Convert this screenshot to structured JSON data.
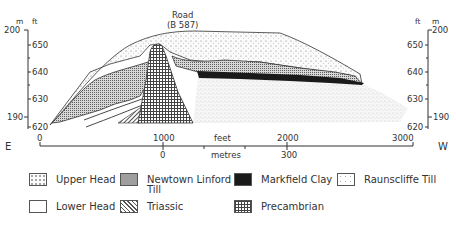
{
  "diagram": {
    "type": "geological cross-section",
    "road_label_line1": "Road",
    "road_label_line2": "(B 587)",
    "left_axis": {
      "unit_m": "m",
      "unit_ft": "ft",
      "m_ticks": [
        "200",
        "190"
      ],
      "ft_ticks": [
        "650",
        "640",
        "630",
        "620"
      ]
    },
    "right_axis": {
      "unit_ft": "ft",
      "unit_m": "m",
      "m_ticks": [
        "200",
        "190"
      ],
      "ft_ticks": [
        "650",
        "640",
        "630",
        "620"
      ]
    },
    "direction_left": "E",
    "direction_right": "W",
    "scale": {
      "feet_label": "feet",
      "metres_label": "metres",
      "feet_ticks": [
        "0",
        "1000",
        "2000",
        "3000"
      ],
      "metres_ticks": [
        "0",
        "300"
      ]
    },
    "units_shown": [
      "Upper Head",
      "Newtown Linford Till",
      "Markfield Clay",
      "Raunscliffe Till",
      "Lower Head",
      "Triassic",
      "Precambrian"
    ]
  },
  "legend": {
    "items": [
      {
        "label": "Upper Head",
        "pattern": "sparse-dots"
      },
      {
        "label": "Newtown Linford",
        "label2": "Till",
        "pattern": "dense-stipple"
      },
      {
        "label": "Markfield Clay",
        "pattern": "solid-black"
      },
      {
        "label": "Raunscliffe Till",
        "pattern": "light-speckle"
      },
      {
        "label": "Lower Head",
        "pattern": "blank"
      },
      {
        "label": "Triassic",
        "pattern": "diagonal-hatch"
      },
      {
        "label": "Precambrian",
        "pattern": "grid"
      }
    ]
  },
  "colors": {
    "line": "#333333",
    "clay": "#1a1a1a",
    "background": "#ffffff"
  }
}
